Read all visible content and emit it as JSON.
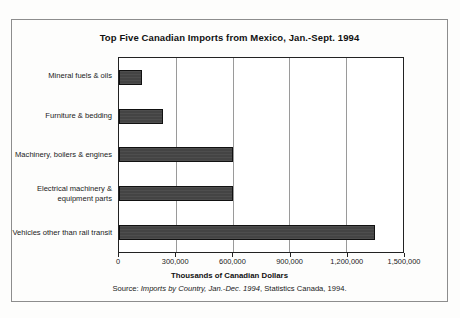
{
  "chart_data": {
    "type": "bar",
    "orientation": "horizontal",
    "title": "Top Five Canadian Imports from Mexico, Jan.-Sept. 1994",
    "xlabel": "Thousands of Canadian Dollars",
    "ylabel": "",
    "categories": [
      "Mineral fuels & oils",
      "Furniture & bedding",
      "Machinery, boilers & engines",
      "Electrical machinery & equipment parts",
      "Vehicles other than rail transit"
    ],
    "values": [
      120000,
      230000,
      600000,
      600000,
      1350000
    ],
    "xlim": [
      0,
      1500000
    ],
    "xticks": [
      0,
      300000,
      600000,
      900000,
      1200000,
      1500000
    ],
    "xticklabels": [
      "0",
      "300,000",
      "600,000",
      "900,000",
      "1,200,000",
      "1,500,000"
    ],
    "grid": "vertical",
    "legend": null,
    "bar_color": "#444444",
    "bar_edge_color": "#111111"
  },
  "source": {
    "prefix": "Source: ",
    "italic_part": "Imports by Country, Jan.-Dec. 1994",
    "suffix": ", Statistics Canada, 1994."
  }
}
